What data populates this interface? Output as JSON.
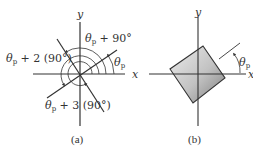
{
  "diagram_a": {
    "axis_x_label": "x",
    "axis_y_label": "y",
    "angle_label_1": {
      "theta": "θ",
      "sub": "p",
      "rest": ""
    },
    "angle_label_2": {
      "theta": "θ",
      "sub": "p",
      "rest": " + 90°"
    },
    "angle_label_3": {
      "theta": "θ",
      "sub": "p",
      "rest": " + 2 (90°)"
    },
    "angle_label_4": {
      "theta": "θ",
      "sub": "p",
      "rest": " + 3 (90°)"
    },
    "caption": "(a)"
  },
  "diagram_b": {
    "axis_x_label_left": "x",
    "axis_x_label_right": "x",
    "axis_y_label": "y",
    "angle_label": {
      "theta": "θ",
      "sub": "p"
    },
    "caption": "(b)"
  },
  "colors": {
    "line": "#333333",
    "square_light": "#e6e6e6",
    "square_dark": "#8a8a8a"
  }
}
